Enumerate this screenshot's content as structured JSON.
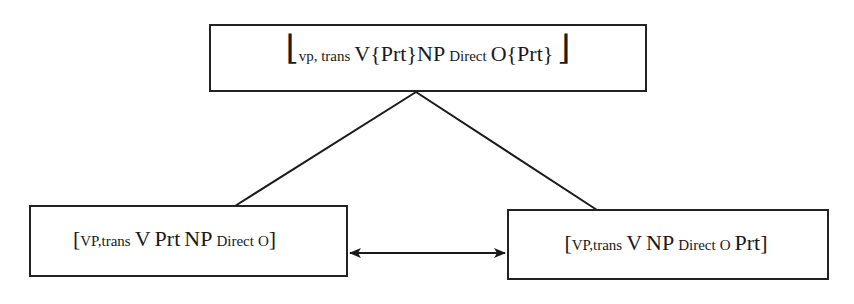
{
  "diagram": {
    "top_node": {
      "open_bracket": "⌊",
      "subscript": "vp, trans",
      "parts": [
        "V",
        "{Prt}",
        "NP",
        "Direct",
        "O",
        "{Prt}"
      ],
      "close_bracket": "⌋"
    },
    "left_node": {
      "open_bracket": "[",
      "subscript": "VP,trans",
      "parts": [
        "V",
        "Prt",
        "NP",
        "Direct",
        "O"
      ],
      "close_bracket": "]"
    },
    "right_node": {
      "open_bracket": "[",
      "subscript": "VP,trans",
      "parts": [
        "V",
        "NP",
        "Direct",
        "O",
        "Prt"
      ],
      "close_bracket": "]"
    },
    "edges": [
      {
        "from": "top_node",
        "to": "left_node",
        "type": "line"
      },
      {
        "from": "top_node",
        "to": "right_node",
        "type": "line"
      },
      {
        "from": "left_node",
        "to": "right_node",
        "type": "double-arrow"
      }
    ],
    "line_color": "#1a1a1a"
  }
}
